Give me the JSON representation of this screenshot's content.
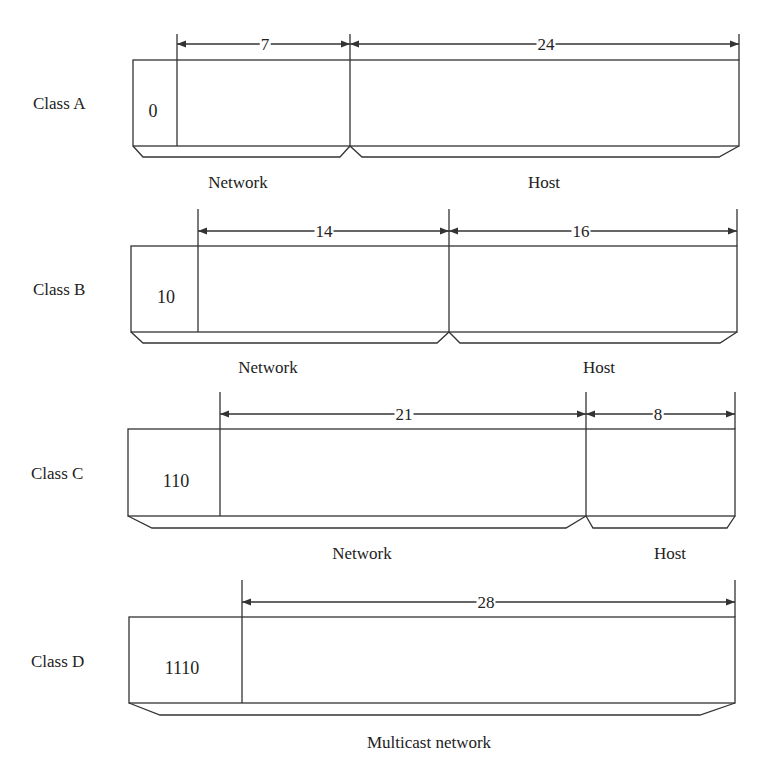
{
  "diagram": {
    "type": "IPv4 classful address formats",
    "stroke_color": "#333333",
    "rows": [
      {
        "class_label": "Class A",
        "prefix_bits": "0",
        "fields": [
          {
            "name": "Network",
            "bits": "7"
          },
          {
            "name": "Host",
            "bits": "24"
          }
        ]
      },
      {
        "class_label": "Class B",
        "prefix_bits": "10",
        "fields": [
          {
            "name": "Network",
            "bits": "14"
          },
          {
            "name": "Host",
            "bits": "16"
          }
        ]
      },
      {
        "class_label": "Class C",
        "prefix_bits": "110",
        "fields": [
          {
            "name": "Network",
            "bits": "21"
          },
          {
            "name": "Host",
            "bits": "8"
          }
        ]
      },
      {
        "class_label": "Class D",
        "prefix_bits": "1110",
        "fields": [
          {
            "name": "Multicast network",
            "bits": "28"
          }
        ]
      }
    ]
  }
}
